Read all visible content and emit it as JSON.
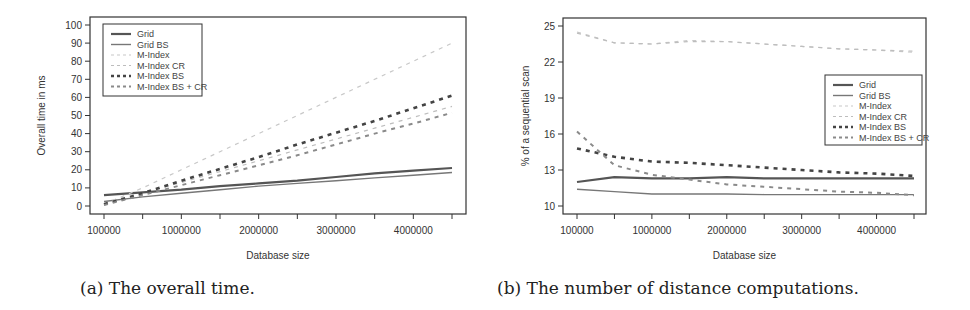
{
  "figures": [
    {
      "caption": "(a) The overall time."
    },
    {
      "caption": "(b) The number of distance computations."
    }
  ],
  "chart_data": [
    {
      "type": "line",
      "title": "",
      "caption": "(a) The overall time.",
      "xlabel": "Database size",
      "ylabel": "Overall time in ms",
      "x": [
        100000,
        500000,
        1000000,
        1500000,
        2000000,
        2500000,
        3000000,
        3500000,
        4000000,
        4500000
      ],
      "x_tick_labels": [
        "100000",
        "1000000",
        "2000000",
        "3000000",
        "4000000"
      ],
      "y_ticks": [
        0,
        10,
        20,
        30,
        40,
        50,
        60,
        70,
        80,
        90,
        100
      ],
      "ylim": [
        0,
        100
      ],
      "grid": false,
      "legend_position": "top-left",
      "series": [
        {
          "name": "Grid",
          "style": "solid-thick",
          "color": "#555555",
          "values": [
            6,
            7.5,
            9,
            11,
            12.5,
            14,
            16,
            18,
            19.5,
            21
          ]
        },
        {
          "name": "Grid BS",
          "style": "solid-thin",
          "color": "#777777",
          "values": [
            2.5,
            5,
            7,
            9,
            11,
            12.5,
            14,
            15.5,
            17,
            18.5
          ]
        },
        {
          "name": "M-Index",
          "style": "dashed-light",
          "color": "#c8c8c8",
          "values": [
            1,
            10,
            20,
            30,
            40,
            50,
            60,
            70,
            80,
            90
          ]
        },
        {
          "name": "M-Index CR",
          "style": "dashed-light",
          "color": "#bdbdbd",
          "values": [
            1,
            7,
            13,
            19,
            25,
            31,
            37,
            43,
            49,
            55
          ]
        },
        {
          "name": "M-Index BS",
          "style": "dashed-dark",
          "color": "#444444",
          "values": [
            1,
            7,
            14,
            20.5,
            27,
            34,
            40.5,
            47,
            54,
            61
          ]
        },
        {
          "name": "M-Index BS + CR",
          "style": "dashed-medium",
          "color": "#8a8a8a",
          "values": [
            0.5,
            6,
            11.5,
            17,
            22.5,
            28,
            34,
            40,
            45.5,
            51.5
          ]
        }
      ]
    },
    {
      "type": "line",
      "title": "",
      "caption": "(b) The number of distance computations.",
      "xlabel": "Database size",
      "ylabel": "% of a sequential scan",
      "x": [
        100000,
        500000,
        1000000,
        1500000,
        2000000,
        2500000,
        3000000,
        3500000,
        4000000,
        4500000
      ],
      "x_tick_labels": [
        "100000",
        "1000000",
        "2000000",
        "3000000",
        "4000000"
      ],
      "y_ticks": [
        10,
        13,
        16,
        19,
        22,
        25
      ],
      "ylim": [
        10,
        25
      ],
      "grid": false,
      "legend_position": "right-middle",
      "series": [
        {
          "name": "Grid",
          "style": "solid-thick",
          "color": "#555555",
          "values": [
            12.0,
            12.4,
            12.3,
            12.3,
            12.4,
            12.3,
            12.3,
            12.3,
            12.3,
            12.3
          ]
        },
        {
          "name": "Grid BS",
          "style": "solid-thin",
          "color": "#777777",
          "values": [
            11.4,
            11.2,
            11.0,
            11.0,
            11.0,
            10.95,
            10.95,
            10.95,
            10.95,
            10.95
          ]
        },
        {
          "name": "M-Index",
          "style": "dashed-light",
          "color": "#c8c8c8",
          "values": [
            24.5,
            23.6,
            23.5,
            23.8,
            23.7,
            23.5,
            23.3,
            23.1,
            23.0,
            22.8
          ]
        },
        {
          "name": "M-Index CR",
          "style": "dashed-light",
          "color": "#bdbdbd",
          "values": [
            24.4,
            23.6,
            23.5,
            23.7,
            23.7,
            23.5,
            23.3,
            23.1,
            23.0,
            22.9
          ]
        },
        {
          "name": "M-Index BS",
          "style": "dashed-dark",
          "color": "#444444",
          "values": [
            14.8,
            14.1,
            13.7,
            13.6,
            13.4,
            13.2,
            13.0,
            12.8,
            12.7,
            12.5
          ]
        },
        {
          "name": "M-Index BS + CR",
          "style": "dashed-medium",
          "color": "#8a8a8a",
          "values": [
            16.2,
            13.4,
            12.6,
            12.2,
            11.8,
            11.6,
            11.4,
            11.2,
            11.1,
            10.9
          ]
        }
      ]
    }
  ]
}
